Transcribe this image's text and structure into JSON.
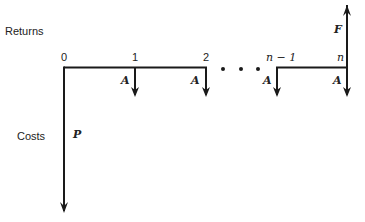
{
  "diagram": {
    "type": "cash-flow-diagram",
    "labels": {
      "returns": "Returns",
      "costs": "Costs"
    },
    "periods": [
      {
        "label": "0",
        "x": 64
      },
      {
        "label": "1",
        "x": 135
      },
      {
        "label": "2",
        "x": 206
      },
      {
        "label": "n − 1",
        "x": 277
      },
      {
        "label": "n",
        "x": 347
      }
    ],
    "ellipsis": "• • •",
    "flows": {
      "present_cost": "P",
      "annuity": "A",
      "future_return": "F"
    },
    "colors": {
      "line": "#1a1a1a",
      "text": "#222222"
    }
  }
}
